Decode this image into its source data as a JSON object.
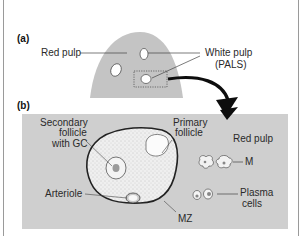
{
  "panels": {
    "a": {
      "label": "(a)",
      "labels": {
        "red_pulp": "Red pulp",
        "white_pulp_line1": "White pulp",
        "white_pulp_line2": "(PALS)"
      }
    },
    "b": {
      "label": "(b)",
      "labels": {
        "secondary_line1": "Secondary",
        "secondary_line2": "follicle",
        "secondary_line3": "with GC",
        "primary_line1": "Primary",
        "primary_line2": "follicle",
        "red_pulp": "Red pulp",
        "m": "M",
        "arteriole": "Arteriole",
        "plasma_line1": "Plasma",
        "plasma_line2": "cells",
        "mz": "MZ"
      }
    }
  },
  "colors": {
    "spleen_fill": "#c4c4c4",
    "panel_bg": "#cfcfcf",
    "follicle_fill": "#ececec",
    "outline": "#333333",
    "arrow": "#0d0d0d"
  }
}
